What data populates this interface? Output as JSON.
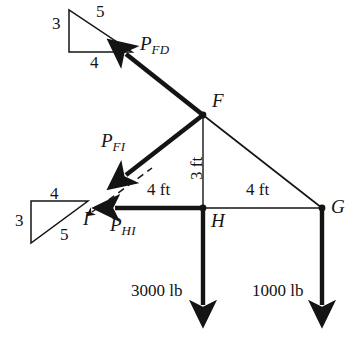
{
  "figure": {
    "type": "statics-truss-free-body-diagram",
    "caption": "",
    "stroke_color": "#141414",
    "member_color": "#141414",
    "background": "#ffffff"
  },
  "nodes": [
    {
      "id": "F",
      "label": "F",
      "x": 203,
      "y": 115
    },
    {
      "id": "H",
      "label": "H",
      "x": 203,
      "y": 208
    },
    {
      "id": "G",
      "label": "G",
      "x": 322,
      "y": 208
    },
    {
      "id": "I",
      "label": "I",
      "x": 96,
      "y": 208
    }
  ],
  "forces": [
    {
      "id": "PFD",
      "symbol": "P",
      "subscript": "FD",
      "label": "P_FD",
      "from": "F",
      "direction": "up-left"
    },
    {
      "id": "PFI",
      "symbol": "P",
      "subscript": "FI",
      "label": "P_FI",
      "from": "F",
      "direction": "down-left"
    },
    {
      "id": "PHI",
      "symbol": "P",
      "subscript": "HI",
      "label": "P_HI",
      "from": "H",
      "direction": "left"
    }
  ],
  "loads": [
    {
      "id": "load-H",
      "value": "3000 lb",
      "at": "H",
      "direction": "down"
    },
    {
      "id": "load-G",
      "value": "1000 lb",
      "at": "G",
      "direction": "down"
    }
  ],
  "dimensions": [
    {
      "id": "dim-IH",
      "label": "4 ft",
      "orientation": "horizontal"
    },
    {
      "id": "dim-HG",
      "label": "4 ft",
      "orientation": "horizontal"
    },
    {
      "id": "dim-FH",
      "label": "3 ft",
      "orientation": "vertical"
    }
  ],
  "slope_triangles": [
    {
      "id": "slope-triangle-top",
      "vertical": "3",
      "horizontal": "4",
      "hypotenuse": "5",
      "orientation": "bottom-right-hypotenuse-down"
    },
    {
      "id": "slope-triangle-bottom",
      "vertical": "3",
      "horizontal": "4",
      "hypotenuse": "5",
      "orientation": "top-right-hypotenuse-down-left"
    }
  ]
}
